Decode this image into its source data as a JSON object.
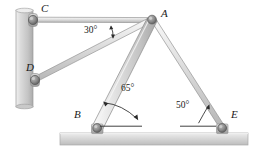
{
  "figure": {
    "points": [
      {
        "id": "C",
        "label": "C",
        "x": 33,
        "y": 20,
        "label_x": 41,
        "label_y": 6,
        "support": "wall-pin"
      },
      {
        "id": "D",
        "label": "D",
        "x": 35,
        "y": 80,
        "label_x": 26,
        "label_y": 64,
        "support": "wall-pin"
      },
      {
        "id": "A",
        "label": "A",
        "x": 152,
        "y": 20,
        "label_x": 162,
        "label_y": 9,
        "support": "joint"
      },
      {
        "id": "B",
        "label": "B",
        "x": 97,
        "y": 128,
        "label_x": 75,
        "label_y": 110,
        "support": "ground-pin"
      },
      {
        "id": "E",
        "label": "E",
        "x": 222,
        "y": 128,
        "label_x": 231,
        "label_y": 110,
        "support": "ground-pin"
      }
    ],
    "members": [
      {
        "id": "CA",
        "from": "C",
        "to": "A",
        "style": "rod"
      },
      {
        "id": "DA",
        "from": "D",
        "to": "A",
        "style": "rod"
      },
      {
        "id": "BA",
        "from": "B",
        "to": "A",
        "style": "beam"
      },
      {
        "id": "AE",
        "from": "A",
        "to": "E",
        "style": "rod"
      }
    ],
    "angles": [
      {
        "id": "angle-30",
        "value": "30°",
        "label_x": 84,
        "label_y": 28,
        "at": "A",
        "between": "CA and DA"
      },
      {
        "id": "angle-65",
        "value": "65°",
        "label_x": 122,
        "label_y": 88,
        "at": "B",
        "between": "BA and ground"
      },
      {
        "id": "angle-50",
        "value": "50°",
        "label_x": 176,
        "label_y": 104,
        "at": "E",
        "between": "AE and ground"
      }
    ],
    "wall": {
      "x": 16,
      "y": 10,
      "width": 17,
      "height": 97
    },
    "ground": {
      "x": 60,
      "y": 133,
      "width": 188,
      "height": 12
    },
    "colors": {
      "member_light": "#e8e8e8",
      "member_mid": "#c9c9c9",
      "member_dark": "#9a9a9a",
      "outline": "#808080",
      "wall_light": "#e2e2e2",
      "wall_dark": "#b4b4b4",
      "ground_light": "#e0e0e0",
      "ground_dark": "#b8b8b8",
      "pin_dark": "#6e6e6e",
      "text": "#1a1a1a"
    }
  }
}
